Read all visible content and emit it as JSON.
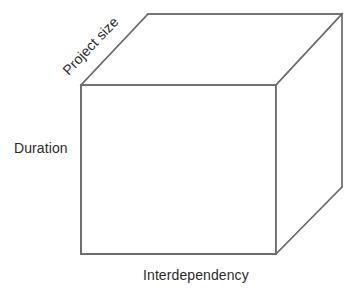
{
  "figure": {
    "type": "diagram",
    "background_color": "#ffffff",
    "line_color": "#6e6e6e",
    "text_color": "#2b2b2b"
  },
  "labels": {
    "depth_axis": "Project size",
    "vertical_axis": "Duration",
    "horizontal_axis": "Interdependency"
  },
  "geometry": {
    "front_face": {
      "top_left": [
        81,
        85
      ],
      "top_right": [
        276,
        85
      ],
      "bottom_right": [
        276,
        254
      ],
      "bottom_left": [
        81,
        254
      ]
    },
    "back_face": {
      "top_left": [
        148,
        14
      ],
      "top_right": [
        342,
        14
      ],
      "bottom_right": [
        342,
        187
      ]
    },
    "depth_edge_angle_deg": -46.6
  }
}
